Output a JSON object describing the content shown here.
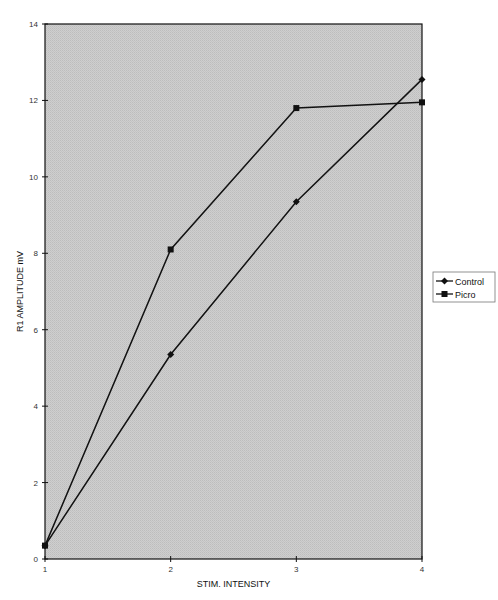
{
  "chart_data": {
    "type": "line",
    "title": "",
    "xlabel": "STIM. INTENSITY",
    "ylabel": "R1 AMPLITUDE mV",
    "x": [
      1,
      2,
      3,
      4
    ],
    "xlim": [
      1,
      4
    ],
    "ylim": [
      0,
      14
    ],
    "xticks": [
      "1",
      "2",
      "3",
      "4"
    ],
    "yticks": [
      "0",
      "2",
      "4",
      "6",
      "8",
      "10",
      "12",
      "14"
    ],
    "grid": false,
    "legend_position": "right",
    "plot_background": "#c8c8c8",
    "series": [
      {
        "name": "Control",
        "marker": "diamond",
        "values": [
          0.35,
          5.35,
          9.35,
          12.55
        ]
      },
      {
        "name": "Picro",
        "marker": "square",
        "values": [
          0.35,
          8.1,
          11.8,
          11.95
        ]
      }
    ]
  }
}
